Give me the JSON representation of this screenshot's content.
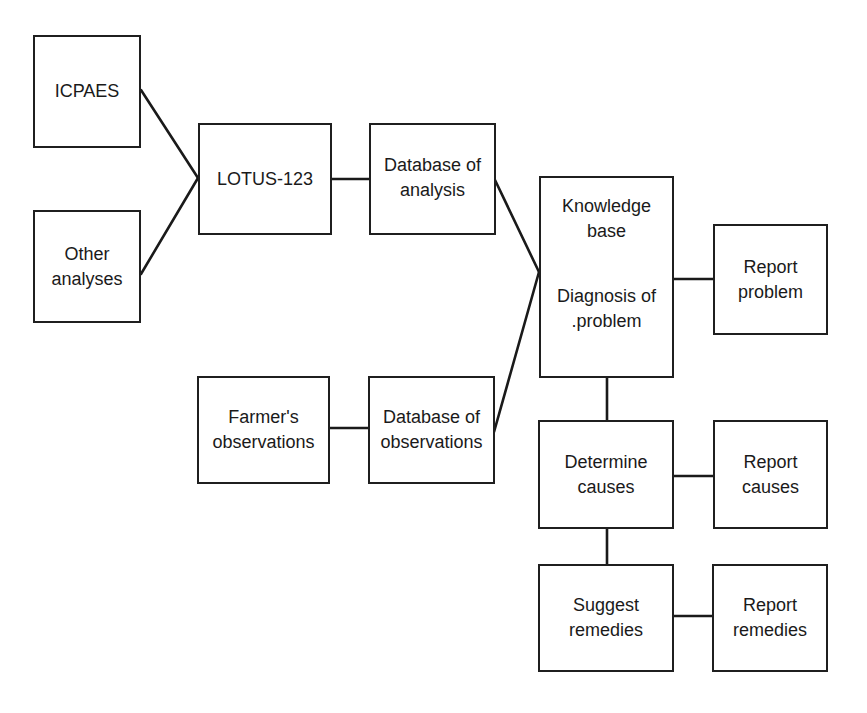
{
  "diagram": {
    "type": "flowchart",
    "nodes": {
      "icpaes": {
        "lines": [
          "ICPAES"
        ]
      },
      "other_analyses": {
        "lines": [
          "Other",
          "analyses"
        ]
      },
      "lotus": {
        "lines": [
          "LOTUS-123"
        ]
      },
      "db_analysis": {
        "lines": [
          "Database of",
          "analysis"
        ]
      },
      "farmers_obs": {
        "lines": [
          "Farmer's",
          "observations"
        ]
      },
      "db_observations": {
        "lines": [
          "Database of",
          "observations"
        ]
      },
      "knowledge_base": {
        "lines": [
          "Knowledge",
          "base",
          "Diagnosis of",
          ".problem"
        ]
      },
      "report_problem": {
        "lines": [
          "Report",
          "problem"
        ]
      },
      "determine_causes": {
        "lines": [
          "Determine",
          "causes"
        ]
      },
      "report_causes": {
        "lines": [
          "Report",
          "causes"
        ]
      },
      "suggest_remedies": {
        "lines": [
          "Suggest",
          "remedies"
        ]
      },
      "report_remedies": {
        "lines": [
          "Report",
          "remedies"
        ]
      }
    },
    "edges": [
      {
        "from": "ICPAES",
        "to": "LOTUS-123"
      },
      {
        "from": "Other analyses",
        "to": "LOTUS-123"
      },
      {
        "from": "LOTUS-123",
        "to": "Database of analysis"
      },
      {
        "from": "Database of analysis",
        "to": "Knowledge base / Diagnosis of problem"
      },
      {
        "from": "Farmer's observations",
        "to": "Database of observations"
      },
      {
        "from": "Database of observations",
        "to": "Knowledge base / Diagnosis of problem"
      },
      {
        "from": "Knowledge base / Diagnosis of problem",
        "to": "Report problem"
      },
      {
        "from": "Knowledge base / Diagnosis of problem",
        "to": "Determine causes"
      },
      {
        "from": "Determine causes",
        "to": "Report causes"
      },
      {
        "from": "Determine causes",
        "to": "Suggest remedies"
      },
      {
        "from": "Suggest remedies",
        "to": "Report remedies"
      }
    ],
    "colors": {
      "stroke": "#1a1a1a",
      "background": "#ffffff",
      "text": "#1a1a1a"
    }
  }
}
